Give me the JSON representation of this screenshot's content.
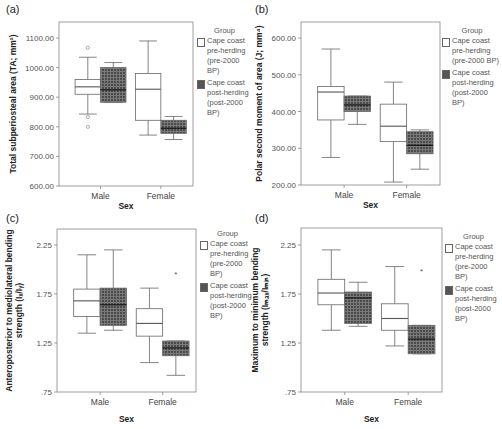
{
  "legend": {
    "title": "Group",
    "items": [
      {
        "label_lines": [
          "Cape coast",
          "pre-herding",
          "(pre-2000 BP)"
        ],
        "fill": "white"
      },
      {
        "label_lines": [
          "Cape coast",
          "post-herding",
          "(post-2000 BP)"
        ],
        "fill": "crosshatch-dark"
      }
    ]
  },
  "colors": {
    "axis": "#888888",
    "box_stroke": "#666666",
    "post_fill": "#5a5a5a",
    "grid_line": "#bbbbbb"
  },
  "chart_data": [
    {
      "panel": "(a)",
      "type": "boxplot",
      "xlabel": "Sex",
      "ylabel": "Total subperiosteal area (TA; mm²)",
      "categories": [
        "Male",
        "Female"
      ],
      "yticks": [
        "600.00",
        "700.00",
        "800.00",
        "900.00",
        "1000.00",
        "1100.00"
      ],
      "ylim": [
        600,
        1150
      ],
      "series": [
        {
          "name": "Cape coast pre-herding (pre-2000 BP)",
          "boxes": [
            {
              "category": "Male",
              "min": 843,
              "q1": 910,
              "median": 935,
              "q3": 960,
              "max": 1035,
              "outliers": [
                1067,
                833,
                800
              ]
            },
            {
              "category": "Female",
              "min": 772,
              "q1": 822,
              "median": 927,
              "q3": 980,
              "max": 1090,
              "outliers": []
            }
          ]
        },
        {
          "name": "Cape coast post-herding (post-2000 BP)",
          "boxes": [
            {
              "category": "Male",
              "min": 883,
              "q1": 883,
              "median": 925,
              "q3": 1000,
              "max": 1017,
              "outliers": []
            },
            {
              "category": "Female",
              "min": 757,
              "q1": 778,
              "median": 795,
              "q3": 822,
              "max": 835,
              "outliers": []
            }
          ]
        }
      ]
    },
    {
      "panel": "(b)",
      "type": "boxplot",
      "xlabel": "Sex",
      "ylabel": "Polar second moment of area (J; mm⁴)",
      "categories": [
        "Male",
        "Female"
      ],
      "yticks": [
        "200.00",
        "300.00",
        "400.00",
        "500.00",
        "600.00"
      ],
      "ylim": [
        200,
        640
      ],
      "series": [
        {
          "name": "Cape coast pre-herding (pre-2000 BP)",
          "boxes": [
            {
              "category": "Male",
              "min": 275,
              "q1": 377,
              "median": 453,
              "q3": 468,
              "max": 570,
              "outliers": []
            },
            {
              "category": "Female",
              "min": 208,
              "q1": 318,
              "median": 360,
              "q3": 420,
              "max": 480,
              "outliers": []
            }
          ]
        },
        {
          "name": "Cape coast post-herding (post-2000 BP)",
          "boxes": [
            {
              "category": "Male",
              "min": 365,
              "q1": 400,
              "median": 418,
              "q3": 442,
              "max": 442,
              "outliers": []
            },
            {
              "category": "Female",
              "min": 243,
              "q1": 285,
              "median": 308,
              "q3": 345,
              "max": 350,
              "outliers": []
            }
          ]
        }
      ]
    },
    {
      "panel": "(c)",
      "type": "boxplot",
      "xlabel": "Sex",
      "ylabel": "Anteroposterior to mediolateral bending strength (Iₓ/Iᵧ)",
      "categories": [
        "Male",
        "Female"
      ],
      "yticks": [
        ".75",
        "1.25",
        "1.75",
        "2.25"
      ],
      "ylim": [
        0.75,
        2.42
      ],
      "series": [
        {
          "name": "Cape coast pre-herding (pre-2000 BP)",
          "boxes": [
            {
              "category": "Male",
              "min": 1.35,
              "q1": 1.52,
              "median": 1.68,
              "q3": 1.8,
              "max": 2.15,
              "outliers": []
            },
            {
              "category": "Female",
              "min": 1.05,
              "q1": 1.32,
              "median": 1.45,
              "q3": 1.6,
              "max": 1.81,
              "outliers": []
            }
          ]
        },
        {
          "name": "Cape coast post-herding (post-2000 BP)",
          "boxes": [
            {
              "category": "Male",
              "min": 1.38,
              "q1": 1.43,
              "median": 1.64,
              "q3": 1.81,
              "max": 2.2,
              "outliers": []
            },
            {
              "category": "Female",
              "min": 0.92,
              "q1": 1.12,
              "median": 1.2,
              "q3": 1.27,
              "max": 1.27,
              "outliers": [
                1.95
              ]
            }
          ]
        }
      ]
    },
    {
      "panel": "(d)",
      "type": "boxplot",
      "xlabel": "Sex",
      "ylabel": "Maximum to minimum bending strength (Iₘₐₓ/Iₘᵢₙ)",
      "categories": [
        "Male",
        "Female"
      ],
      "yticks": [
        ".75",
        "1.25",
        "1.75",
        "2.25"
      ],
      "ylim": [
        0.75,
        2.42
      ],
      "series": [
        {
          "name": "Cape coast pre-herding (pre-2000 BP)",
          "boxes": [
            {
              "category": "Male",
              "min": 1.38,
              "q1": 1.64,
              "median": 1.76,
              "q3": 1.9,
              "max": 2.2,
              "outliers": []
            },
            {
              "category": "Female",
              "min": 1.22,
              "q1": 1.38,
              "median": 1.5,
              "q3": 1.65,
              "max": 2.03,
              "outliers": []
            }
          ]
        },
        {
          "name": "Cape coast post-herding (post-2000 BP)",
          "boxes": [
            {
              "category": "Male",
              "min": 1.42,
              "q1": 1.45,
              "median": 1.71,
              "q3": 1.77,
              "max": 1.87,
              "outliers": []
            },
            {
              "category": "Female",
              "min": 1.14,
              "q1": 1.14,
              "median": 1.29,
              "q3": 1.43,
              "max": 1.43,
              "outliers": [
                1.98
              ]
            }
          ]
        }
      ]
    }
  ],
  "layout": [
    {
      "ox": 0,
      "oy": 0,
      "plot": {
        "x": 59,
        "y": 22,
        "w": 134,
        "h": 164
      },
      "ymin": 600,
      "ymax": 1100,
      "y_at_min": 186,
      "y_at_max": 38,
      "ytitle_lines": [
        "Total subperiosteal area (TA; mm²)"
      ]
    },
    {
      "ox": 0,
      "oy": 0,
      "plot": {
        "x": 301,
        "y": 22,
        "w": 139,
        "h": 163
      },
      "ymin": 200,
      "ymax": 600,
      "y_at_min": 185,
      "y_at_max": 38,
      "ytitle_lines": [
        "Polar second moment of area (J; mm⁴)"
      ]
    },
    {
      "ox": 0,
      "oy": 0,
      "plot": {
        "x": 57,
        "y": 229,
        "w": 139,
        "h": 163
      },
      "ymin": 0.75,
      "ymax": 2.25,
      "y_at_min": 392,
      "y_at_max": 245,
      "ytitle_lines": [
        "Anteroposterior to mediolateral bending",
        "strength (Iₓ/Iᵧ)"
      ]
    },
    {
      "ox": 0,
      "oy": 0,
      "plot": {
        "x": 301,
        "y": 228,
        "w": 141,
        "h": 164
      },
      "ymin": 0.75,
      "ymax": 2.25,
      "y_at_min": 392,
      "y_at_max": 245,
      "ytitle_lines": [
        "Maximum to minimum bending",
        "strength (Iₘₐₓ/Iₘᵢₙ)"
      ]
    }
  ]
}
